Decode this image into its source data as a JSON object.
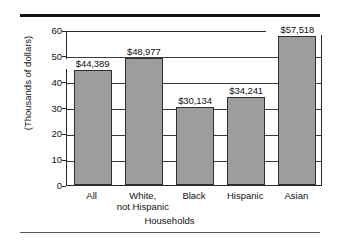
{
  "chart_data": {
    "type": "bar",
    "title": "",
    "xlabel": "Households",
    "ylabel": "(Thousands of dollars)",
    "categories": [
      "All",
      "White,\nnot Hispanic",
      "Black",
      "Hispanic",
      "Asian"
    ],
    "category_labels": [
      {
        "line1": "All",
        "line2": ""
      },
      {
        "line1": "White,",
        "line2": "not Hispanic"
      },
      {
        "line1": "Black",
        "line2": ""
      },
      {
        "line1": "Hispanic",
        "line2": ""
      },
      {
        "line1": "Asian",
        "line2": ""
      }
    ],
    "values": [
      44.389,
      48.977,
      30.134,
      34.241,
      57.518
    ],
    "data_labels": [
      "$44,389",
      "$48,977",
      "$30,134",
      "$34,241",
      "$57,518"
    ],
    "ylim": [
      0,
      60
    ],
    "ytick_values": [
      0,
      10,
      20,
      30,
      40,
      50,
      60
    ],
    "ytick_labels": [
      "0",
      "10",
      "20",
      "30",
      "40",
      "50",
      "60"
    ],
    "grid": true,
    "grid_axis": "y",
    "legend": "none",
    "bar_color": "#9d9d9d",
    "bar_edge_color": "#2f2f2f",
    "axis_color": "#2a2a2a",
    "rule_color": "#111111"
  }
}
